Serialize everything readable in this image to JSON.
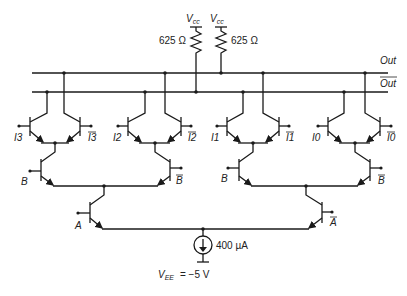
{
  "supply": {
    "vcc_label": "V",
    "vcc_sub": "cc",
    "r_left": "625 Ω",
    "r_right": "625 Ω"
  },
  "outputs": {
    "out": "Out",
    "out_bar": "Out"
  },
  "inputs": {
    "pair3": {
      "left": "I3",
      "right": "I3"
    },
    "pair2": {
      "left": "I2",
      "right": "I2"
    },
    "pair1": {
      "left": "I1",
      "right": "I1"
    },
    "pair0": {
      "left": "I0",
      "right": "I0"
    }
  },
  "selects": {
    "b_left": "B",
    "b_left_bar": "B",
    "b_right": "B",
    "b_right_bar": "B",
    "a": "A",
    "a_bar": "A"
  },
  "current_source": {
    "value": "400 µA",
    "vee_label": "V",
    "vee_sub": "EE",
    "vee_value": "= −5 V"
  }
}
